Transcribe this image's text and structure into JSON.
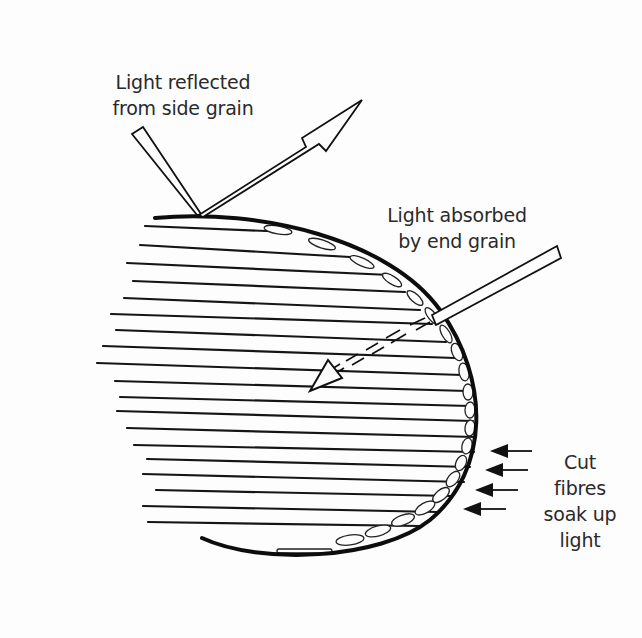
{
  "diagram": {
    "labels": {
      "reflected": {
        "line1": "Light reflected",
        "line2": "from side grain"
      },
      "absorbed": {
        "line1": "Light absorbed",
        "line2": "by end grain"
      },
      "cut_fibres": {
        "line1": "Cut",
        "line2": "fibres",
        "line3": "soak up",
        "line4": "light"
      }
    },
    "elements": {
      "incident_beam_reflected": "narrow-beam-icon",
      "reflected_arrow": "hollow-arrow-icon",
      "incident_beam_absorbed": "narrow-beam-icon",
      "absorbed_dashed_arrow": "dashed-arrow-icon",
      "fibre_arrows_count": 4,
      "grain_lines_count": 18,
      "cut_fibre_cells": "ellipse-cells"
    },
    "colors": {
      "ink": "#111111",
      "text": "#2a2a2a",
      "background": "#fdfdfd"
    }
  }
}
